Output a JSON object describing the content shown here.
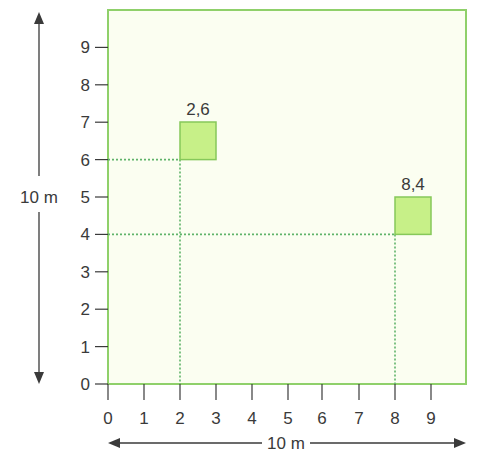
{
  "colors": {
    "field_fill": "#fbfef1",
    "field_border": "#8fd06a",
    "square_fill": "#c7f088",
    "square_border": "#86c85a",
    "guide_line": "#5fb36a",
    "axis": "#3a3a3a"
  },
  "dimensions": {
    "height_label": "10 m",
    "width_label": "10 m"
  },
  "axes": {
    "x_ticks": [
      "0",
      "1",
      "2",
      "3",
      "4",
      "5",
      "6",
      "7",
      "8",
      "9"
    ],
    "y_ticks": [
      "0",
      "1",
      "2",
      "3",
      "4",
      "5",
      "6",
      "7",
      "8",
      "9"
    ]
  },
  "points": [
    {
      "label": "2,6",
      "x": 2,
      "y": 6
    },
    {
      "label": "8,4",
      "x": 8,
      "y": 4
    }
  ]
}
